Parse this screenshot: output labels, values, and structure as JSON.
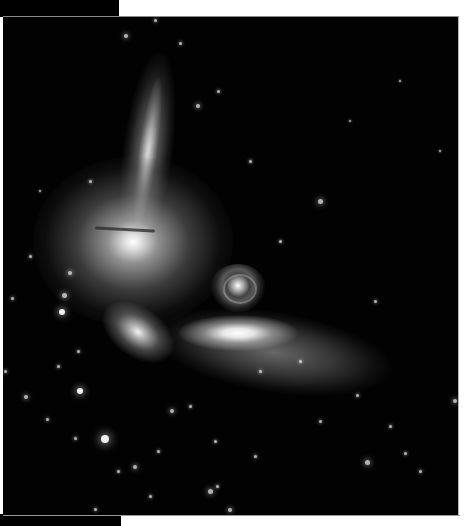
{
  "image": {
    "subject": "compact group of interacting galaxies",
    "alt": "Deep-space photograph of a compact galaxy group: an edge-on spiral, a bright elliptical with a dust lane, a small face-on spiral and an elongated tidal plume against a star field",
    "background_color": "#020202",
    "frame_color": "#ffffff"
  },
  "objects": [
    {
      "name": "edge-on-spiral-galaxy",
      "x": 145,
      "y": 60,
      "w": 36,
      "h": 165,
      "rotate": 8
    },
    {
      "name": "elliptical-galaxy-with-dust-lane",
      "x": 130,
      "y": 226,
      "w": 150,
      "h": 130
    },
    {
      "name": "face-on-spiral-galaxy",
      "x": 236,
      "y": 283,
      "w": 50,
      "h": 44
    },
    {
      "name": "lenticular-galaxy-left",
      "x": 138,
      "y": 328,
      "w": 70,
      "h": 28,
      "rotate": 30
    },
    {
      "name": "central-elongated-galaxy",
      "x": 228,
      "y": 328,
      "w": 110,
      "h": 30
    },
    {
      "name": "tidal-plume",
      "x": 270,
      "y": 338,
      "w": 240,
      "h": 70
    }
  ],
  "stars": [
    [
      126,
      35,
      2
    ],
    [
      155,
      19,
      1.5
    ],
    [
      180,
      42,
      1.5
    ],
    [
      198,
      105,
      2
    ],
    [
      218,
      90,
      1.5
    ],
    [
      320,
      200,
      2.5
    ],
    [
      280,
      240,
      1.5
    ],
    [
      30,
      255,
      1.5
    ],
    [
      70,
      272,
      2
    ],
    [
      64,
      294,
      2.5
    ],
    [
      62,
      311,
      3
    ],
    [
      12,
      297,
      1.5
    ],
    [
      78,
      350,
      1.5
    ],
    [
      5,
      370,
      1.5
    ],
    [
      58,
      365,
      1.5
    ],
    [
      80,
      390,
      3
    ],
    [
      26,
      396,
      2
    ],
    [
      47,
      418,
      1.5
    ],
    [
      105,
      438,
      4
    ],
    [
      75,
      437,
      1.5
    ],
    [
      135,
      466,
      2
    ],
    [
      118,
      470,
      1.5
    ],
    [
      158,
      450,
      1.5
    ],
    [
      210,
      490,
      2.5
    ],
    [
      230,
      509,
      2
    ],
    [
      217,
      485,
      1.5
    ],
    [
      367,
      461,
      2.5
    ],
    [
      405,
      452,
      1.5
    ],
    [
      320,
      420,
      1.5
    ],
    [
      357,
      394,
      1.5
    ],
    [
      455,
      400,
      2
    ],
    [
      390,
      425,
      1.5
    ],
    [
      420,
      470,
      1.5
    ],
    [
      375,
      300,
      1.5
    ],
    [
      300,
      360,
      1.5
    ],
    [
      260,
      370,
      1.5
    ],
    [
      190,
      405,
      1.5
    ],
    [
      172,
      410,
      2
    ],
    [
      255,
      455,
      1.5
    ],
    [
      215,
      440,
      1.5
    ],
    [
      440,
      150,
      1.2
    ],
    [
      350,
      120,
      1.2
    ],
    [
      400,
      80,
      1.2
    ],
    [
      90,
      180,
      1.5
    ],
    [
      40,
      190,
      1.2
    ],
    [
      250,
      160,
      1.5
    ],
    [
      150,
      495,
      1.5
    ],
    [
      95,
      508,
      1.5
    ]
  ]
}
